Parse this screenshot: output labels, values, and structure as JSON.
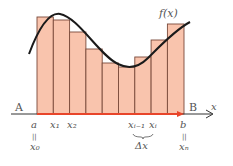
{
  "diagram": {
    "type": "riemann-sum",
    "curve_label": "f(x)",
    "axis_label": "x",
    "start_point_label": "A",
    "end_point_label": "B",
    "lower_bound": "a",
    "lower_bound_index": "x₀",
    "upper_bound": "b",
    "upper_bound_index": "xₙ",
    "equals_sign": "||",
    "tick_labels": [
      "x₁",
      "x₂",
      "xᵢ₋₁",
      "xᵢ"
    ],
    "delta_label": "Δx",
    "bar_count": 9,
    "colors": {
      "bar_fill": "#f9c4ad",
      "bar_stroke": "#7a4a3a",
      "curve": "#1a1a1a",
      "axis": "#333333",
      "interval_arrow": "#e8452a",
      "text": "#555555"
    }
  }
}
